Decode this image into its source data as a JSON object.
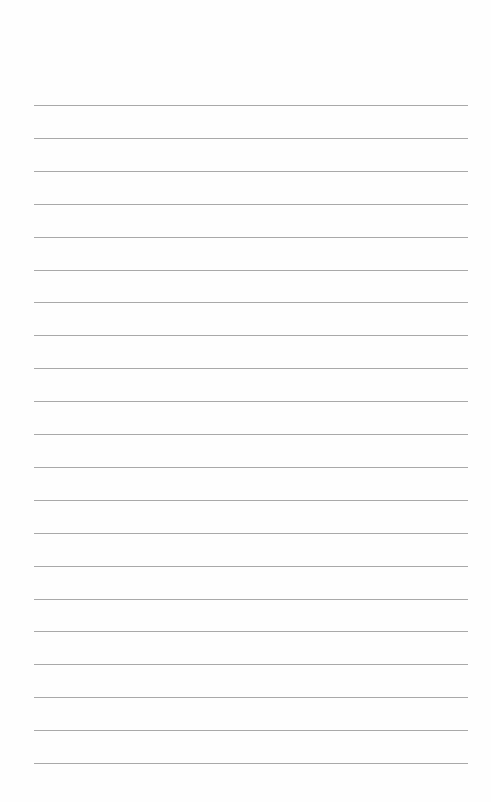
{
  "page": {
    "type": "lined-paper",
    "background": "#fefefe",
    "rule_color": "#9a9a9a",
    "rule_count": 21,
    "first_rule_y": 105,
    "rule_spacing": 32.9,
    "rule_left": 34,
    "rule_width": 434
  }
}
